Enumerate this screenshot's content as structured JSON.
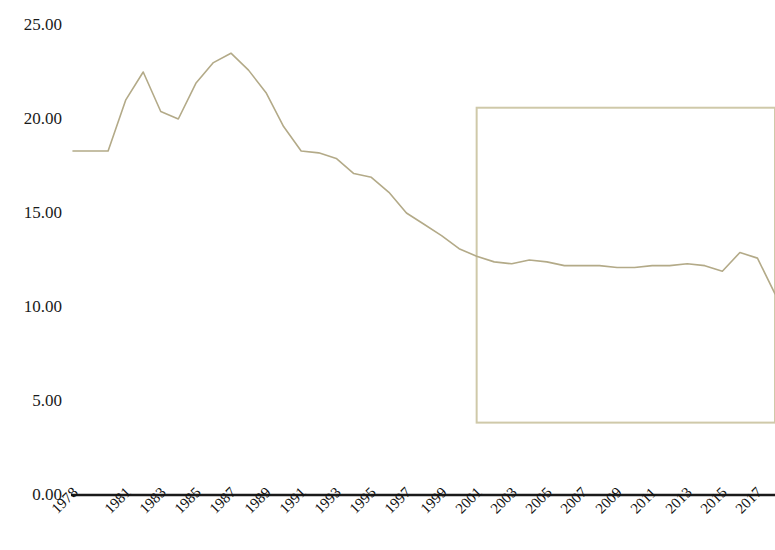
{
  "chart_data": {
    "type": "line",
    "title": "",
    "subtitle": "",
    "xlabel": "",
    "ylabel": "",
    "ylim": [
      0,
      25
    ],
    "ytick_labels": [
      "25.00",
      "20.00",
      "15.00",
      "10.00",
      "5.00",
      "0.00"
    ],
    "ytick_values": [
      25,
      20,
      15,
      10,
      5,
      0
    ],
    "ytick_step": 5,
    "grid": false,
    "legend": null,
    "legend_position": "none",
    "axis_line_color": "#1a1a1a",
    "series": [
      {
        "name": "series-1",
        "color": "#b3aa88",
        "line_width": 1.6,
        "marker": "none",
        "x": [
          1978,
          1979,
          1980,
          1981,
          1982,
          1983,
          1984,
          1985,
          1986,
          1987,
          1988,
          1989,
          1990,
          1991,
          1992,
          1993,
          1994,
          1995,
          1996,
          1997,
          1998,
          1999,
          2000,
          2001,
          2002,
          2003,
          2004,
          2005,
          2006,
          2007,
          2008,
          2009,
          2010,
          2011,
          2012,
          2013,
          2014,
          2015,
          2016,
          2017,
          2018
        ],
        "values": [
          18.3,
          18.3,
          18.3,
          21.0,
          22.5,
          20.4,
          20.0,
          21.9,
          23.0,
          23.5,
          22.6,
          21.4,
          19.6,
          18.3,
          18.2,
          17.9,
          17.1,
          16.9,
          16.1,
          15.0,
          14.4,
          13.8,
          13.1,
          12.7,
          12.4,
          12.3,
          12.5,
          12.4,
          12.2,
          12.2,
          12.2,
          12.1,
          12.1,
          12.2,
          12.2,
          12.3,
          12.2,
          11.9,
          12.9,
          12.6,
          10.7
        ]
      }
    ],
    "x_tick_labels": [
      "1978",
      "1981",
      "1983",
      "1985",
      "1987",
      "1989",
      "1991",
      "1993",
      "1995",
      "1997",
      "1999",
      "2001",
      "2003",
      "2005",
      "2007",
      "2009",
      "2011",
      "2013",
      "2015",
      "2017"
    ],
    "x_tick_years": [
      1978,
      1981,
      1983,
      1985,
      1987,
      1989,
      1991,
      1993,
      1995,
      1997,
      1999,
      2001,
      2003,
      2005,
      2007,
      2009,
      2011,
      2013,
      2015,
      2017
    ],
    "annotations": [
      {
        "type": "rectangle",
        "name": "highlight-rectangle",
        "x_start": 2001,
        "x_end": 2018,
        "y_top": 20.6,
        "y_bottom": 3.85,
        "stroke": "#cfc9a9",
        "fill": "none",
        "stroke_width": 2
      }
    ],
    "colors": {
      "line": "#b3aa88",
      "rectangle": "#cfc9a9",
      "axis": "#1a1a1a",
      "text": "#111111",
      "background": "#ffffff"
    }
  }
}
